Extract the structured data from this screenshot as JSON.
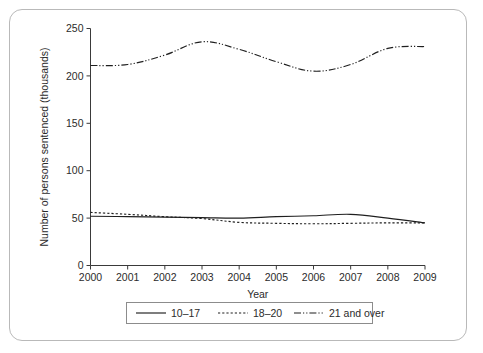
{
  "chart_data": {
    "type": "line",
    "title": "",
    "xlabel": "Year",
    "ylabel": "Number of persons sentenced (thousands)",
    "x": [
      2000,
      2001,
      2002,
      2003,
      2004,
      2005,
      2006,
      2007,
      2008,
      2009
    ],
    "xtick_labels": [
      "2000",
      "2001",
      "2002",
      "2003",
      "2004",
      "2005",
      "2006",
      "2007",
      "2008",
      "2009"
    ],
    "ytick_labels": [
      "0",
      "50",
      "100",
      "150",
      "200",
      "250"
    ],
    "yticks": [
      0,
      50,
      100,
      150,
      200,
      250
    ],
    "ylim": [
      0,
      250
    ],
    "xlim": [
      2000,
      2009
    ],
    "grid": false,
    "legend_position": "below-plot",
    "series": [
      {
        "name": "10–17",
        "line_style": "solid",
        "color": "#1f1f1f",
        "values": [
          52,
          51.5,
          51,
          50.5,
          50,
          51.5,
          52.5,
          54,
          50,
          45
        ]
      },
      {
        "name": "18–20",
        "line_style": "dotted",
        "color": "#1f1f1f",
        "values": [
          56,
          54,
          51.5,
          49.5,
          45.5,
          44.5,
          44,
          44.5,
          45,
          45
        ]
      },
      {
        "name": "21 and over",
        "line_style": "dash-dot-dot",
        "color": "#1f1f1f",
        "values": [
          211,
          212,
          222,
          236,
          228,
          215,
          205,
          212,
          229,
          231
        ]
      }
    ]
  },
  "legend": {
    "items": [
      {
        "label": "10–17",
        "key": "series-10-17"
      },
      {
        "label": "18–20",
        "key": "series-18-20"
      },
      {
        "label": "21 and over",
        "key": "series-21-over"
      }
    ]
  },
  "axes": {
    "x_title": "Year",
    "y_title": "Number of persons sentenced (thousands)"
  }
}
